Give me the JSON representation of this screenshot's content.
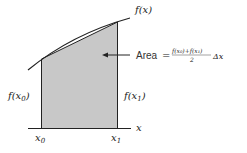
{
  "diagram": {
    "colors": {
      "shade": "#c8c8c8",
      "line": "#222222",
      "text": "#222222"
    },
    "labels": {
      "curve": "f(x)",
      "left_height": "f(x",
      "left_height_sub": "0",
      "right_height": "f(x",
      "right_height_sub": "1",
      "axis": "x",
      "x0": "x",
      "x0_sub": "0",
      "x1": "x",
      "x1_sub": "1",
      "area_word": "Area",
      "equals": "=",
      "numerator": "f(x₀)+f(x₁)",
      "denominator": "2",
      "delta": "Δx",
      "close_paren": ")"
    }
  }
}
